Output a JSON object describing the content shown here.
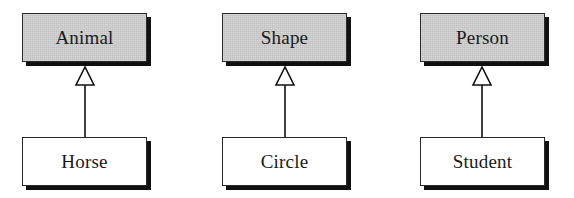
{
  "diagram": {
    "type": "UML class inheritance (generalization)",
    "relationships": [
      {
        "superclass": "Animal",
        "subclass": "Horse"
      },
      {
        "superclass": "Shape",
        "subclass": "Circle"
      },
      {
        "superclass": "Person",
        "subclass": "Student"
      }
    ],
    "colors": {
      "superclass_fill": "#cfcfcf",
      "subclass_fill": "#ffffff",
      "border": "#2a2a2a",
      "shadow": "#111111",
      "arrow": "#111111"
    },
    "arrow_style": "hollow-triangle"
  }
}
